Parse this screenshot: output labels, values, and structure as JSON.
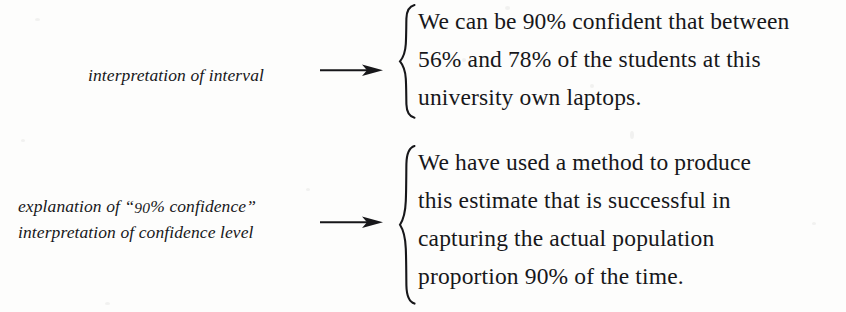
{
  "page": {
    "background_color": "#fdfdfc",
    "ink_color": "#17171a",
    "width": 846,
    "height": 312
  },
  "annotations": [
    {
      "id": "interval-interpretation",
      "label_lines": [
        "interpretation of interval"
      ],
      "arrow": "right-arrow",
      "brace": "left-curly-brace",
      "text_lines": [
        "We can be 90% confident that between",
        "56% and 78% of the students at this",
        "university own laptops."
      ]
    },
    {
      "id": "confidence-level-interpretation",
      "label_lines": [
        "explanation of “90% confidence”",
        "interpretation of confidence level"
      ],
      "arrow": "right-arrow",
      "brace": "left-curly-brace",
      "text_lines": [
        "We have used a method to produce",
        "this estimate that is successful in",
        "capturing the actual population",
        "proportion 90% of the time."
      ]
    }
  ],
  "labels": {
    "row1_line1": "interpretation of interval",
    "row2_line1_prefix": "explanation of “",
    "row2_line1_number": "90",
    "row2_line1_suffix": "% confidence”",
    "row2_line2": "interpretation of confidence level"
  },
  "body": {
    "row1_line1": "We can be 90% confident that between",
    "row1_line2": "56% and 78% of the students at this",
    "row1_line3": "university own laptops.",
    "row2_line1": "We have used a method to produce",
    "row2_line2": "this estimate that is successful in",
    "row2_line3": "capturing the actual population",
    "row2_line4": "proportion 90% of the time."
  }
}
